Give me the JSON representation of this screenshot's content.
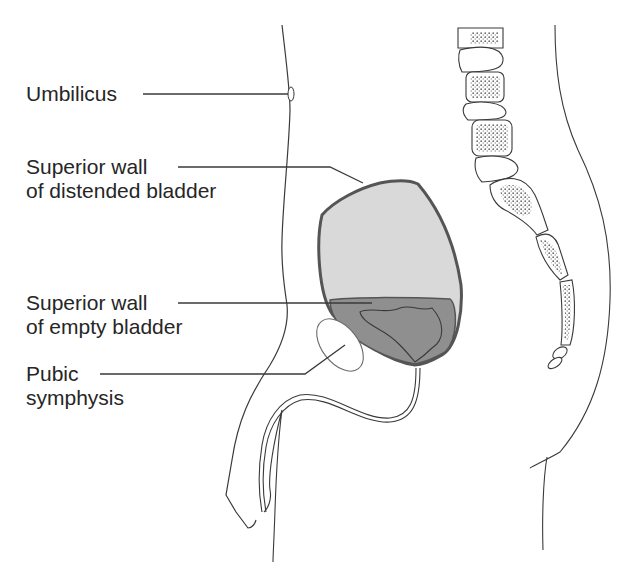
{
  "figure": {
    "labels": [
      {
        "id": "umbilicus",
        "lines": [
          "Umbilicus"
        ]
      },
      {
        "id": "superior-wall-distended",
        "lines": [
          "Superior wall",
          "of distended bladder"
        ]
      },
      {
        "id": "superior-wall-empty",
        "lines": [
          "Superior wall",
          "of empty bladder"
        ]
      },
      {
        "id": "pubic-symphysis",
        "lines": [
          "Pubic",
          "symphysis"
        ]
      }
    ]
  },
  "colors": {
    "stroke": "#3a3a3a",
    "distended_fill": "#d9d9d9",
    "empty_fill": "#8f8f8f",
    "bladder_outline": "#555555",
    "text": "#262626"
  }
}
